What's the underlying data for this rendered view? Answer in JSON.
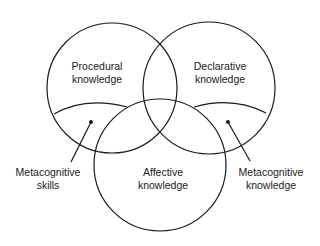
{
  "diagram": {
    "type": "venn",
    "circles": [
      {
        "id": "procedural",
        "label_lines": [
          "Procedural",
          "knowledge"
        ]
      },
      {
        "id": "declarative",
        "label_lines": [
          "Declarative",
          "knowledge"
        ]
      },
      {
        "id": "affective",
        "label_lines": [
          "Affective",
          "knowledge"
        ]
      }
    ],
    "callouts": [
      {
        "id": "metacognitive-skills",
        "label_lines": [
          "Metacognitive",
          "skills"
        ],
        "region": "lower segment of Procedural knowledge"
      },
      {
        "id": "metacognitive-knowledge",
        "label_lines": [
          "Metacognitive",
          "knowledge"
        ],
        "region": "lower segment of Declarative knowledge"
      }
    ],
    "colors": {
      "stroke": "#1a1a1a",
      "background": "#ffffff"
    }
  }
}
